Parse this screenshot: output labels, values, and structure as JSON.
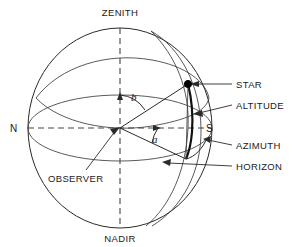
{
  "figure": {
    "background_color": "#ffffff",
    "line_color": "#2a2a2a",
    "accent_color": "#111111"
  },
  "labels": {
    "zenith": "ZENITH",
    "nadir": "NADIR",
    "north": "N",
    "south": "S",
    "observer": "OBSERVER",
    "star": "STAR",
    "altitude": "ALTITUDE",
    "azimuth": "AZIMUTH",
    "horizon": "HORIZON",
    "angle_a": "a",
    "angle_b": "b"
  },
  "geometry": {
    "sphere_center_x": 120,
    "sphere_center_y": 128,
    "sphere_radius_x": 92,
    "sphere_radius_y": 100,
    "star_x": 188,
    "star_y": 84,
    "horizon_ellipse_ry": 33,
    "zenith_y": 28,
    "nadir_y": 228
  },
  "callouts": [
    {
      "name": "star",
      "text": "STAR",
      "x": 238,
      "y": 87
    },
    {
      "name": "altitude",
      "text": "ALTITUDE",
      "x": 238,
      "y": 108
    },
    {
      "name": "azimuth",
      "text": "AZIMUTH",
      "x": 238,
      "y": 148
    },
    {
      "name": "horizon",
      "text": "HORIZON",
      "x": 238,
      "y": 169
    }
  ]
}
